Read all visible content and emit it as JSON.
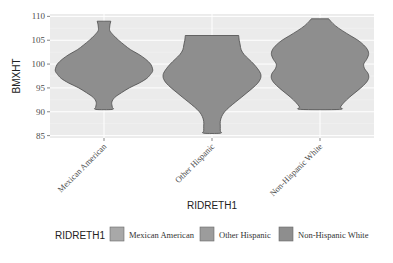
{
  "chart_data": {
    "type": "violin",
    "title": "",
    "xlabel": "RIDRETH1",
    "ylabel": "BMXHT",
    "categories": [
      "Mexican American",
      "Other Hispanic",
      "Non-Hispanic White"
    ],
    "ylim": [
      84.5,
      110.5
    ],
    "yticks": [
      85,
      90,
      95,
      100,
      105,
      110
    ],
    "grid": true,
    "legend": {
      "title": "RIDRETH1",
      "position": "bottom",
      "entries": [
        "Mexican American",
        "Other Hispanic",
        "Non-Hispanic White"
      ]
    },
    "series": [
      {
        "name": "Mexican American",
        "min": 90.5,
        "max": 109,
        "mode": 98.5,
        "profile": [
          [
            109,
            0.14
          ],
          [
            108,
            0.12
          ],
          [
            107,
            0.12
          ],
          [
            106,
            0.2
          ],
          [
            105,
            0.3
          ],
          [
            104,
            0.42
          ],
          [
            103,
            0.55
          ],
          [
            102,
            0.72
          ],
          [
            101,
            0.86
          ],
          [
            100,
            0.96
          ],
          [
            99,
            1.0
          ],
          [
            98.5,
            1.0
          ],
          [
            98,
            0.97
          ],
          [
            97,
            0.88
          ],
          [
            96,
            0.72
          ],
          [
            95,
            0.52
          ],
          [
            94,
            0.36
          ],
          [
            93,
            0.22
          ],
          [
            92,
            0.16
          ],
          [
            91,
            0.17
          ],
          [
            90.5,
            0.17
          ]
        ]
      },
      {
        "name": "Other Hispanic",
        "min": 85.5,
        "max": 106,
        "mode": 97.5,
        "profile": [
          [
            106,
            0.55
          ],
          [
            105,
            0.56
          ],
          [
            104,
            0.58
          ],
          [
            103,
            0.6
          ],
          [
            102,
            0.66
          ],
          [
            101,
            0.76
          ],
          [
            100,
            0.86
          ],
          [
            99,
            0.94
          ],
          [
            98,
            1.0
          ],
          [
            97,
            1.0
          ],
          [
            96,
            0.94
          ],
          [
            95,
            0.84
          ],
          [
            94,
            0.72
          ],
          [
            93,
            0.6
          ],
          [
            92,
            0.48
          ],
          [
            91,
            0.36
          ],
          [
            90,
            0.26
          ],
          [
            89,
            0.2
          ],
          [
            88,
            0.17
          ],
          [
            87,
            0.17
          ],
          [
            86,
            0.17
          ],
          [
            85.5,
            0.17
          ]
        ]
      },
      {
        "name": "Non-Hispanic White",
        "min": 90.5,
        "max": 109.5,
        "mode": 98,
        "profile": [
          [
            109.5,
            0.18
          ],
          [
            109,
            0.22
          ],
          [
            108,
            0.32
          ],
          [
            107,
            0.46
          ],
          [
            106,
            0.62
          ],
          [
            105,
            0.78
          ],
          [
            104,
            0.9
          ],
          [
            103,
            0.98
          ],
          [
            102,
            1.0
          ],
          [
            101,
            0.96
          ],
          [
            100,
            0.9
          ],
          [
            99,
            0.92
          ],
          [
            98,
            0.99
          ],
          [
            97,
            1.0
          ],
          [
            96,
            0.94
          ],
          [
            95,
            0.84
          ],
          [
            94,
            0.72
          ],
          [
            93,
            0.6
          ],
          [
            92,
            0.5
          ],
          [
            91,
            0.42
          ],
          [
            90.5,
            0.4
          ]
        ]
      }
    ]
  },
  "colors": {
    "panel_bg": "#ebebeb",
    "grid_major": "#ffffff",
    "violin_fill": "#8e8e8e",
    "violin_stroke": "#4d4d4d",
    "legend_keys": [
      "#a8a8a8",
      "#9c9c9c",
      "#8e8e8e"
    ],
    "axis_text": "#4d4d4d",
    "title_text": "#222222"
  }
}
